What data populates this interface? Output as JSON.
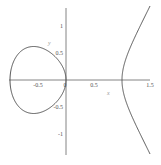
{
  "chart_data": {
    "type": "line",
    "title": "",
    "xlabel": "x",
    "ylabel": "y",
    "equation": "y^2 = x^3 - x",
    "xlim": [
      -1,
      1.5
    ],
    "ylim": [
      -1.4,
      1.4
    ],
    "grid": false,
    "x_ticks": [
      {
        "value": -0.5,
        "label": "-0.5"
      },
      {
        "value": 0,
        "label": "0"
      },
      {
        "value": 0.5,
        "label": "0.5"
      },
      {
        "value": 1.5,
        "label": "1.5"
      }
    ],
    "y_ticks": [
      {
        "value": 1,
        "label": "1"
      },
      {
        "value": 0.5,
        "label": "0.5"
      },
      {
        "value": -0.5,
        "label": "-0.5"
      },
      {
        "value": -1,
        "label": "-1"
      }
    ],
    "series": [
      {
        "name": "oval",
        "x_range": [
          -1,
          0
        ],
        "color": "#555555"
      },
      {
        "name": "right-branch",
        "x_range": [
          1,
          1.5
        ],
        "color": "#555555"
      }
    ]
  }
}
